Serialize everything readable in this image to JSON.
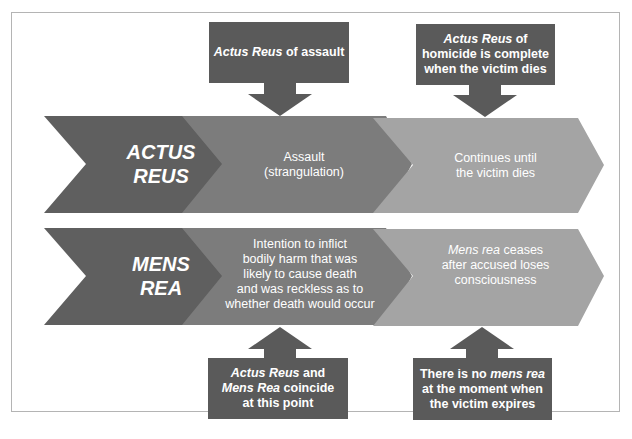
{
  "colors": {
    "dark": "#5f5f5f",
    "mid": "#7c7c7c",
    "light": "#a4a4a4",
    "callout": "#5a5a5a",
    "text": "#ffffff",
    "frame_border": "#b4b4b4"
  },
  "rows": [
    {
      "id": "actus-reus",
      "header": [
        "ACTUS",
        "REUS"
      ],
      "stage1": [
        "Assault",
        "(strangulation)"
      ],
      "stage2": [
        "Continues until",
        "the victim dies"
      ]
    },
    {
      "id": "mens-rea",
      "header": [
        "MENS",
        "REA"
      ],
      "stage1": [
        "Intention to inflict",
        "bodily harm that was",
        "likely to cause death",
        "and was reckless as to",
        "whether death would occur"
      ],
      "stage2_italic": "Mens rea",
      "stage2_rest": " ceases",
      "stage2_lines": [
        "after accused loses",
        "consciousness"
      ]
    }
  ],
  "callouts": {
    "top_left": {
      "italic": "Actus Reus",
      "rest": " of assault",
      "direction": "down"
    },
    "top_right": {
      "italic": "Actus Reus",
      "rest": " of",
      "lines": [
        "homicide is complete",
        "when the victim dies"
      ],
      "direction": "down"
    },
    "bottom_left": {
      "line1_italic": "Actus Reus",
      "line1_rest": " and",
      "line2_italic": "Mens Rea",
      "line2_rest": " coincide",
      "line3": "at this point",
      "direction": "up"
    },
    "bottom_right": {
      "line1_plain": "There is no ",
      "line1_italic": "mens rea",
      "line2": "at the moment when",
      "line3": "the victim expires",
      "direction": "up"
    }
  }
}
